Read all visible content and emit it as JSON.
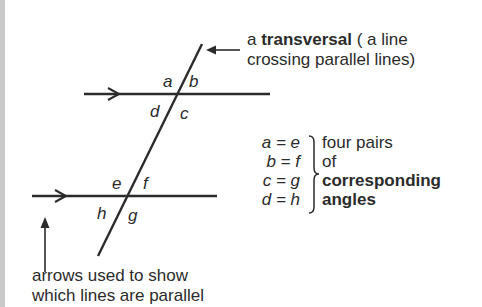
{
  "diagram": {
    "colors": {
      "line": "#2b2b2b",
      "side_bar": "#c9c9c9",
      "background": "#ffffff"
    },
    "angle_labels": {
      "top": [
        "a",
        "b",
        "d",
        "c"
      ],
      "bottom": [
        "e",
        "f",
        "h",
        "g"
      ]
    },
    "transversal_note": {
      "prefix": "a ",
      "bold": "transversal",
      "suffix": " ( a line",
      "line2": "crossing parallel lines)"
    },
    "equalities": [
      {
        "lhs": "a = e",
        "desc": "four pairs",
        "bold": false
      },
      {
        "lhs": "b = f",
        "desc": "of",
        "bold": false
      },
      {
        "lhs": "c = g",
        "desc": "corresponding",
        "bold": true
      },
      {
        "lhs": "d = h",
        "desc": "angles",
        "bold": true
      }
    ],
    "parallel_note": {
      "line1": "arrows used to show",
      "line2": "which lines are parallel"
    },
    "icons": {
      "parallel_marker": "right-chevron-arrow",
      "pointer_left": "left-arrow",
      "pointer_up": "up-arrow",
      "brace": "right-curly-brace"
    }
  }
}
